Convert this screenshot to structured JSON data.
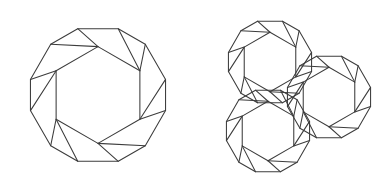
{
  "page": {
    "background_color": "#ffffff",
    "line_color": "#3c3c3c",
    "line_width": 1.05,
    "width": 392,
    "height": 189
  },
  "figures": [
    {
      "id": "single-cell",
      "label": "Single truncated octahedron cell",
      "cells": 1,
      "center": [
        98,
        95
      ],
      "radius": 78,
      "truncation": 0.3
    },
    {
      "id": "three-cell-cluster",
      "label": "Three-cell honeycomb cluster",
      "cells": 3,
      "centers": [
        [
          270,
          62
        ],
        [
          268,
          131
        ],
        [
          329,
          97
        ]
      ],
      "radius": 48,
      "truncation": 0.3
    }
  ],
  "geometry": {
    "outline_note": "Each cell is a hexagonal outline whose six corners are truncated, producing six quadrilateral corner facets around a central hexagonal face, plus a square facet at top and bottom.",
    "hex_angles_deg": [
      90,
      30,
      330,
      270,
      210,
      150
    ],
    "corner_cut_ratio": 0.3,
    "inner_hex_ratio": 0.62
  }
}
